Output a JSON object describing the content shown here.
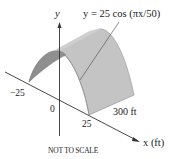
{
  "diagram": {
    "type": "3d-surface-sketch",
    "equation_label": "y = 25 cos (πx/50)",
    "axes": {
      "y_label": "y",
      "x_label": "x (ft)"
    },
    "tick_labels": {
      "neg": "−25",
      "zero": "0",
      "pos": "25"
    },
    "length_label": "300 ft",
    "note": "NOT TO SCALE",
    "colors": {
      "front_face": "#8f8f8f",
      "roof_surface": "#c4c4c4",
      "edge": "#7a7a7a",
      "axis": "#333333"
    }
  }
}
